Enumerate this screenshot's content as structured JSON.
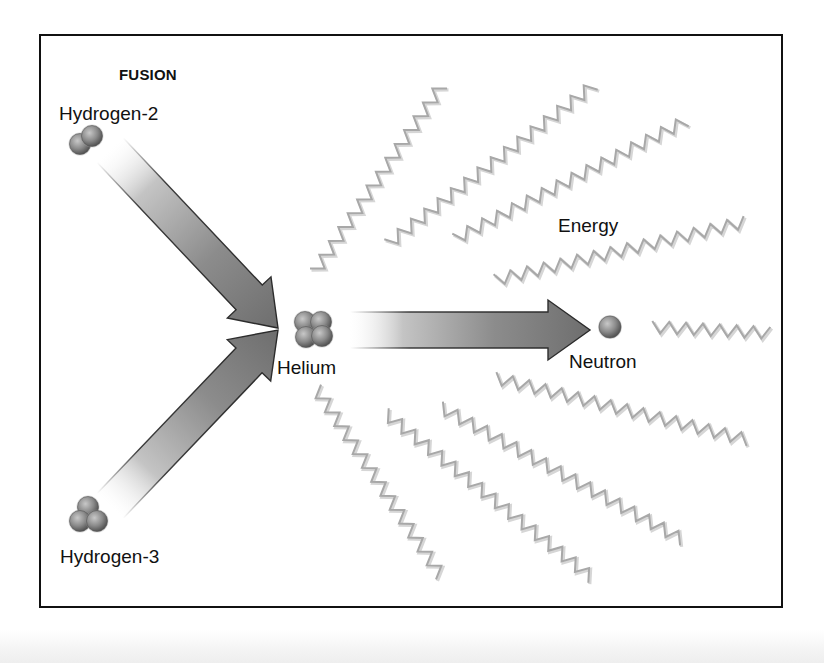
{
  "diagram": {
    "title": "FUSION",
    "labels": {
      "hydrogen2": "Hydrogen-2",
      "hydrogen3": "Hydrogen-3",
      "helium": "Helium",
      "neutron": "Neutron",
      "energy": "Energy"
    },
    "colors": {
      "frame": "#111111",
      "text": "#111111",
      "arrow_dark": "#6e6e6e",
      "arrow_light": "#f2f2f2",
      "arrow_outline": "#2a2a2a",
      "particle_light": "#c8c8c8",
      "particle_mid": "#8a8a8a",
      "particle_dark": "#4a4a4a",
      "wave": "#a8a8a8",
      "wave_shadow": "#d6d6d6"
    },
    "nodes": [
      {
        "id": "hydrogen2",
        "particles": 2,
        "x": 86,
        "y": 140
      },
      {
        "id": "hydrogen3",
        "particles": 3,
        "x": 89,
        "y": 516
      },
      {
        "id": "helium",
        "particles": 4,
        "x": 313,
        "y": 329
      },
      {
        "id": "neutron",
        "particles": 1,
        "x": 610,
        "y": 327
      }
    ],
    "arrows": [
      {
        "id": "h2-to-he",
        "from": [
          110,
          150
        ],
        "to": [
          278,
          328
        ]
      },
      {
        "id": "h3-to-he",
        "from": [
          110,
          506
        ],
        "to": [
          278,
          330
        ]
      },
      {
        "id": "he-to-n",
        "from": [
          350,
          330
        ],
        "to": [
          590,
          330
        ]
      }
    ],
    "waves": [
      {
        "x1": 315,
        "y1": 272,
        "x2": 442,
        "y2": 85
      },
      {
        "x1": 388,
        "y1": 244,
        "x2": 594,
        "y2": 85
      },
      {
        "x1": 455,
        "y1": 239,
        "x2": 686,
        "y2": 121
      },
      {
        "x1": 495,
        "y1": 280,
        "x2": 745,
        "y2": 222
      },
      {
        "x1": 652,
        "y1": 327,
        "x2": 770,
        "y2": 333
      },
      {
        "x1": 495,
        "y1": 378,
        "x2": 748,
        "y2": 440
      },
      {
        "x1": 440,
        "y1": 407,
        "x2": 683,
        "y2": 540
      },
      {
        "x1": 385,
        "y1": 413,
        "x2": 592,
        "y2": 578
      },
      {
        "x1": 316,
        "y1": 388,
        "x2": 441,
        "y2": 576
      }
    ]
  }
}
